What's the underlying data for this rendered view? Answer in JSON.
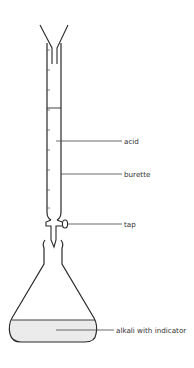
{
  "diagram": {
    "type": "titration apparatus",
    "labels": {
      "acid": "acid",
      "burette": "burette",
      "tap": "tap",
      "alkali": "alkali with indicator"
    },
    "colors": {
      "stroke": "#2a2a2a",
      "liquid": "#ebebeb",
      "text": "#333333"
    }
  }
}
